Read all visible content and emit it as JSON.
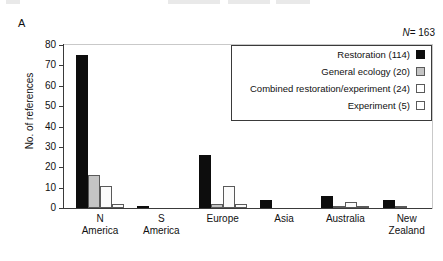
{
  "panel": {
    "letter": "A"
  },
  "chart_data": {
    "type": "bar",
    "title": "",
    "subtitle": "",
    "xlabel": "",
    "ylabel": "No. of references",
    "ylim": [
      0,
      80
    ],
    "yticks": [
      0,
      10,
      20,
      30,
      40,
      50,
      60,
      70,
      80
    ],
    "grid": false,
    "legend_position": "top-right",
    "annotation": "N = 163",
    "annotation_symbol": "N",
    "annotation_value": "= 163",
    "categories": [
      "N America",
      "S America",
      "Europe",
      "Asia",
      "Australia",
      "New Zealand"
    ],
    "category_lines": [
      [
        "N",
        "America"
      ],
      [
        "S",
        "America"
      ],
      [
        "Europe",
        ""
      ],
      [
        "Asia",
        ""
      ],
      [
        "Australia",
        ""
      ],
      [
        "New",
        "Zealand"
      ]
    ],
    "series": [
      {
        "name": "Restoration (114)",
        "label": "Restoration (114)",
        "swatch": "black",
        "color": "#0d0d0d",
        "values": [
          75,
          1,
          26,
          4,
          6,
          4
        ]
      },
      {
        "name": "General ecology (20)",
        "label": "General ecology (20)",
        "swatch": "gray",
        "color": "#c4c4c4",
        "values": [
          16,
          0,
          2,
          0,
          1,
          1
        ]
      },
      {
        "name": "Combined restoration/experiment (24)",
        "label": "Combined restoration/experiment (24)",
        "swatch": "white",
        "color": "#fbfbfb",
        "values": [
          11,
          0,
          11,
          0,
          3,
          0
        ]
      },
      {
        "name": "Experiment (5)",
        "label": "Experiment (5)",
        "swatch": "white",
        "color": "#fbfbfb",
        "values": [
          2,
          0,
          2,
          0,
          1,
          0
        ]
      }
    ]
  },
  "legend": {
    "items": [
      {
        "label": "Restoration (114)",
        "swatch": "black"
      },
      {
        "label": "General ecology (20)",
        "swatch": "gray"
      },
      {
        "label": "Combined restoration/experiment (24)",
        "swatch": "white"
      },
      {
        "label": "Experiment (5)",
        "swatch": "white"
      }
    ]
  }
}
